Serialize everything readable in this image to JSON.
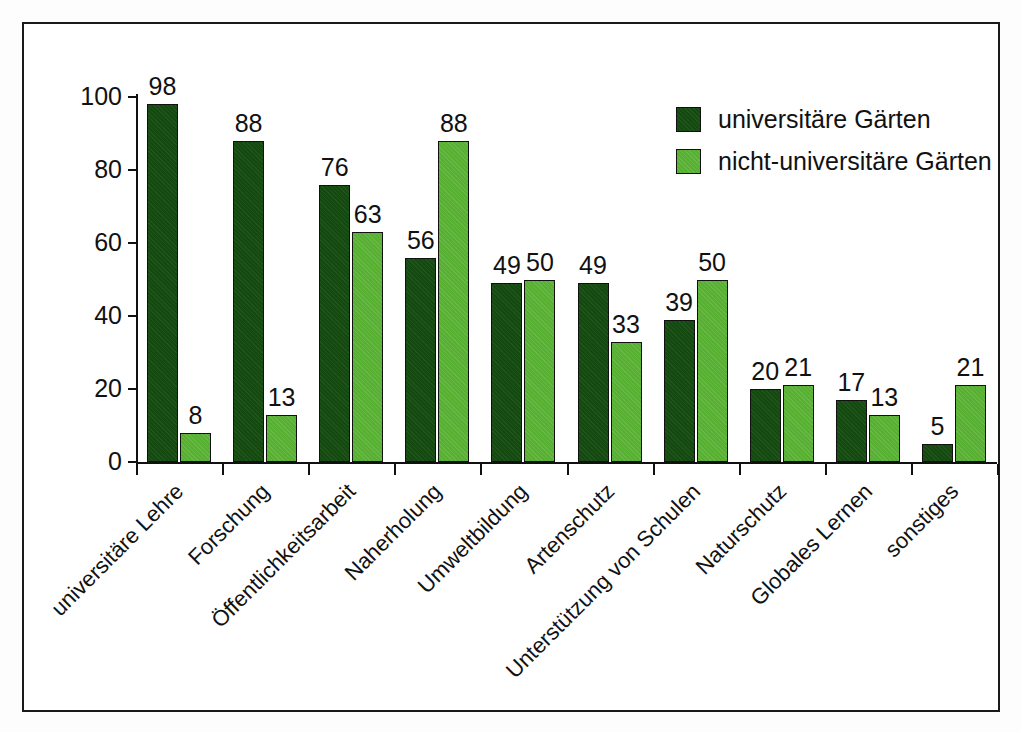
{
  "chart_data": {
    "type": "bar",
    "title": "",
    "subtitle": "",
    "xlabel": "",
    "ylabel": "",
    "ylim": [
      0,
      100
    ],
    "yticks": [
      0,
      20,
      40,
      60,
      80,
      100
    ],
    "ytick_labels": [
      "0",
      "20",
      "40",
      "60",
      "80",
      "100"
    ],
    "grid": false,
    "legend_position": "top-right",
    "show_data_labels": true,
    "categories": [
      "universitäre Lehre",
      "Forschung",
      "Öffentlichkeitsarbeit",
      "Naherholung",
      "Umweltbildung",
      "Artenschutz",
      "Unterstützung von Schulen",
      "Naturschutz",
      "Globales Lernen",
      "sonstiges"
    ],
    "series": [
      {
        "name": "universitäre Gärten",
        "color": "#14490f",
        "values": [
          98,
          88,
          76,
          56,
          49,
          49,
          39,
          20,
          17,
          5
        ]
      },
      {
        "name": "nicht-universitäre Gärten",
        "color": "#57b032",
        "values": [
          8,
          13,
          63,
          88,
          50,
          33,
          50,
          21,
          13,
          21
        ]
      }
    ]
  },
  "figure": {
    "frame_color": "#1a1a1a",
    "background": "#ffffff",
    "axis_color": "#111111"
  }
}
